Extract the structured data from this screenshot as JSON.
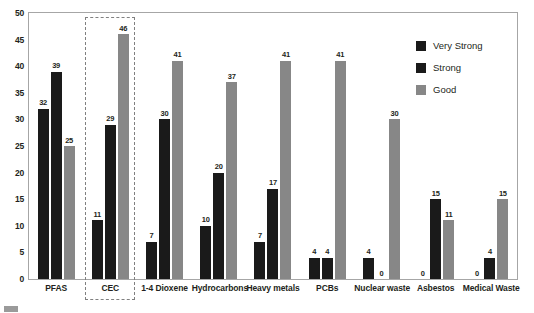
{
  "chart_data": {
    "type": "bar",
    "title": "",
    "subtitle": "",
    "xlabel": "",
    "ylabel": "",
    "ylim": [
      0,
      50
    ],
    "yticks": [
      0,
      5,
      10,
      15,
      20,
      25,
      30,
      35,
      40,
      45,
      50
    ],
    "grid": false,
    "legend_position": "top-right",
    "categories": [
      "PFAS",
      "CEC",
      "1-4 Dioxene",
      "Hydrocarbons",
      "Heavy metals",
      "PCBs",
      "Nuclear waste",
      "Asbestos",
      "Medical Waste"
    ],
    "series": [
      {
        "name": "Very Strong",
        "color": "#1a1a1a",
        "values": [
          32,
          11,
          7,
          10,
          7,
          4,
          4,
          0,
          0
        ]
      },
      {
        "name": "Strong",
        "color": "#1a1a1a",
        "values": [
          39,
          29,
          30,
          20,
          17,
          4,
          0,
          15,
          4
        ]
      },
      {
        "name": "Good",
        "color": "#878787",
        "values": [
          25,
          46,
          41,
          37,
          41,
          41,
          30,
          11,
          15
        ]
      }
    ],
    "annotations": [
      {
        "type": "highlight-box",
        "style": "dashed",
        "color": "#808080",
        "target_category": "CEC"
      }
    ]
  },
  "legend": {
    "items": [
      {
        "label": "Very Strong",
        "swatch": "s-very-strong"
      },
      {
        "label": "Strong",
        "swatch": "s-strong"
      },
      {
        "label": "Good",
        "swatch": "s-good"
      }
    ]
  },
  "artifact": {
    "text": ""
  }
}
